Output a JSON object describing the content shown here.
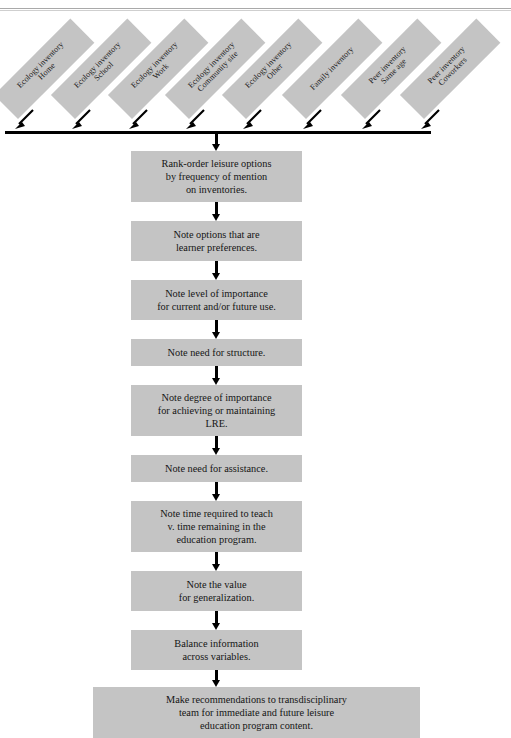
{
  "diagram": {
    "colors": {
      "box_fill": "#c4c4c4",
      "arrow": "#000000",
      "text": "#151515",
      "rule": "#a9a9a9",
      "page_background": "#ffffff"
    },
    "sources": [
      {
        "line1": "Ecology inventory",
        "line2": "Home"
      },
      {
        "line1": "Ecology inventory",
        "line2": "School"
      },
      {
        "line1": "Ecology inventory",
        "line2": "Work"
      },
      {
        "line1": "Ecology inventory",
        "line2": "Community site"
      },
      {
        "line1": "Ecology inventory",
        "line2": "Other"
      },
      {
        "line1": "Family inventory",
        "line2": ""
      },
      {
        "line1": "Peer inventory",
        "line2": "Same age"
      },
      {
        "line1": "Peer inventory",
        "line2": "Coworkers"
      }
    ],
    "steps": [
      {
        "lines": [
          "Rank-order leisure options",
          "by frequency of mention",
          "on inventories."
        ]
      },
      {
        "lines": [
          "Note options that are",
          "learner preferences."
        ]
      },
      {
        "lines": [
          "Note level of importance",
          "for current and/or future use."
        ]
      },
      {
        "lines": [
          "Note need for structure."
        ]
      },
      {
        "lines": [
          "Note degree of importance",
          "for achieving or maintaining",
          "LRE."
        ]
      },
      {
        "lines": [
          "Note need for assistance."
        ]
      },
      {
        "lines": [
          "Note time required to teach",
          "v. time remaining in the",
          "education program."
        ]
      },
      {
        "lines": [
          "Note the value",
          "for generalization."
        ]
      },
      {
        "lines": [
          "Balance information",
          "across variables."
        ]
      },
      {
        "lines": [
          "Make recommendations to transdisciplinary",
          "team for immediate and future leisure",
          "education program content."
        ]
      }
    ]
  }
}
